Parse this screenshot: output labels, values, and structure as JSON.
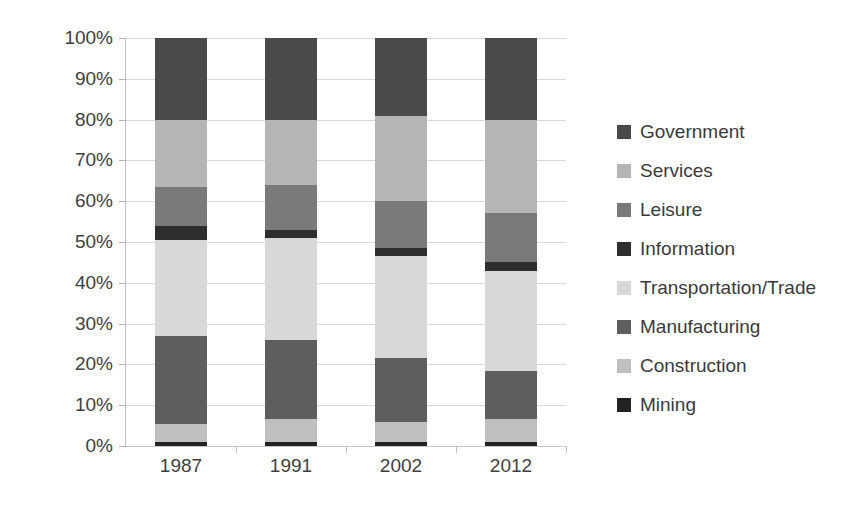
{
  "chart_data": {
    "type": "bar",
    "subtype": "stacked-percent",
    "title": "",
    "xlabel": "",
    "ylabel": "",
    "categories": [
      "1987",
      "1991",
      "2002",
      "2012"
    ],
    "ylim": [
      0,
      100
    ],
    "y_ticks": [
      0,
      10,
      20,
      30,
      40,
      50,
      60,
      70,
      80,
      90,
      100
    ],
    "y_tick_labels": [
      "0%",
      "10%",
      "20%",
      "30%",
      "40%",
      "50%",
      "60%",
      "70%",
      "80%",
      "90%",
      "100%"
    ],
    "grid": true,
    "legend_position": "right",
    "stack_order_bottom_to_top": [
      "Mining",
      "Construction",
      "Manufacturing",
      "Transportation/Trade",
      "Information",
      "Leisure",
      "Services",
      "Government"
    ],
    "series": [
      {
        "name": "Government",
        "color": "#4a4a4a",
        "values": [
          20.0,
          20.0,
          19.0,
          20.0
        ]
      },
      {
        "name": "Services",
        "color": "#b5b5b5",
        "values": [
          16.5,
          16.0,
          21.0,
          23.0
        ]
      },
      {
        "name": "Leisure",
        "color": "#7a7a7a",
        "values": [
          9.5,
          11.0,
          11.5,
          12.0
        ]
      },
      {
        "name": "Information",
        "color": "#2e2e2e",
        "values": [
          3.5,
          2.0,
          2.0,
          2.0
        ]
      },
      {
        "name": "Transportation/Trade",
        "color": "#d8d8d8",
        "values": [
          23.5,
          25.0,
          25.0,
          24.5
        ]
      },
      {
        "name": "Manufacturing",
        "color": "#5e5e5e",
        "values": [
          21.5,
          19.5,
          15.5,
          12.0
        ]
      },
      {
        "name": "Construction",
        "color": "#bfbfbf",
        "values": [
          4.5,
          5.5,
          5.0,
          5.5
        ]
      },
      {
        "name": "Mining",
        "color": "#222222",
        "values": [
          1.0,
          1.0,
          1.0,
          1.0
        ]
      }
    ],
    "stack_tops_percent": {
      "1987": {
        "Mining": 1.0,
        "Construction": 5.5,
        "Manufacturing": 27.0,
        "Transportation/Trade": 50.5,
        "Information": 54.0,
        "Leisure": 63.5,
        "Services": 80.0,
        "Government": 100.0
      },
      "1991": {
        "Mining": 1.0,
        "Construction": 6.5,
        "Manufacturing": 26.0,
        "Transportation/Trade": 51.0,
        "Information": 53.0,
        "Leisure": 64.0,
        "Services": 80.0,
        "Government": 100.0
      },
      "2002": {
        "Mining": 1.0,
        "Construction": 6.0,
        "Manufacturing": 21.5,
        "Transportation/Trade": 46.5,
        "Information": 48.5,
        "Leisure": 60.0,
        "Services": 81.0,
        "Government": 100.0
      },
      "2012": {
        "Mining": 1.0,
        "Construction": 6.5,
        "Manufacturing": 18.5,
        "Transportation/Trade": 43.0,
        "Information": 45.0,
        "Leisure": 57.0,
        "Services": 80.0,
        "Government": 100.0
      }
    }
  },
  "legend": {
    "items": [
      {
        "label": "Government",
        "color": "#4a4a4a"
      },
      {
        "label": "Services",
        "color": "#b5b5b5"
      },
      {
        "label": "Leisure",
        "color": "#7a7a7a"
      },
      {
        "label": "Information",
        "color": "#2e2e2e"
      },
      {
        "label": "Transportation/Trade",
        "color": "#d8d8d8"
      },
      {
        "label": "Manufacturing",
        "color": "#5e5e5e"
      },
      {
        "label": "Construction",
        "color": "#bfbfbf"
      },
      {
        "label": "Mining",
        "color": "#222222"
      }
    ]
  }
}
